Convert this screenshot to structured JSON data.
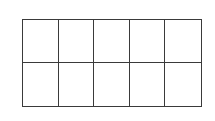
{
  "diagram": {
    "type": "ten-frame",
    "rows": 2,
    "columns": 5,
    "filled_cells": 0,
    "line_color": "#3a3a3a",
    "background_color": "#ffffff"
  }
}
